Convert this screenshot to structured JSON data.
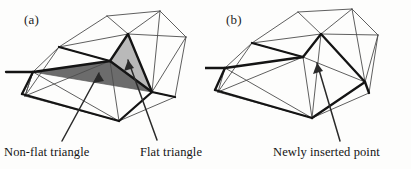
{
  "figure": {
    "background_color": "#fdfdfc",
    "ink_color": "#1d1d1d",
    "thin_line_color": "#4a4a4a",
    "thick_line_color": "#1a1a1a",
    "flat_triangle_fill": "#b9b9b9",
    "nonflat_triangle_fill": "#6c6c6c"
  },
  "panels": [
    {
      "id": "a",
      "tag": "(a)",
      "captions": [
        {
          "id": "nonflat",
          "text": "Non-flat triangle"
        },
        {
          "id": "flat",
          "text": "Flat triangle"
        }
      ]
    },
    {
      "id": "b",
      "tag": "(b)",
      "captions": [
        {
          "id": "newpoint",
          "text": "Newly inserted point"
        }
      ]
    }
  ],
  "labels": {
    "panel_a_tag": "(a)",
    "panel_b_tag": "(b)",
    "non_flat_triangle": "Non-flat triangle",
    "flat_triangle": "Flat triangle",
    "newly_inserted_point": "Newly inserted point"
  }
}
